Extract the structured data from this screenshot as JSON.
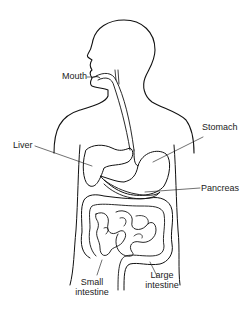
{
  "diagram": {
    "labels": {
      "mouth": "Mouth",
      "liver": "Liver",
      "stomach": "Stomach",
      "pancreas": "Pancreas",
      "small_intestine_line1": "Small",
      "small_intestine_line2": "intestine",
      "large_intestine_line1": "Large",
      "large_intestine_line2": "intestine"
    },
    "colors": {
      "line": "#111111",
      "text": "#222222",
      "background": "#ffffff"
    }
  }
}
